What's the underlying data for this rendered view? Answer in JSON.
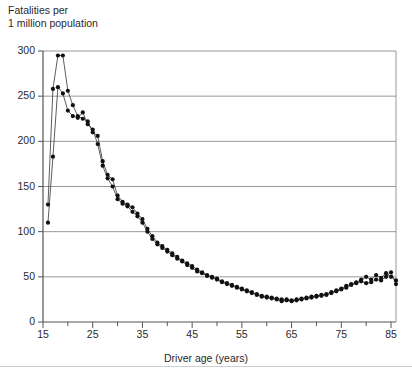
{
  "chart_data": {
    "type": "scatter",
    "title": "",
    "ylabel": "Fatalities per\n1 million population",
    "xlabel": "Driver age (years)",
    "xlim": [
      15,
      86
    ],
    "ylim": [
      0,
      300
    ],
    "yticks": [
      0,
      50,
      100,
      150,
      200,
      250,
      300
    ],
    "xticks": [
      15,
      20,
      25,
      30,
      35,
      40,
      45,
      50,
      55,
      60,
      65,
      70,
      75,
      80,
      85
    ],
    "xtick_labels": [
      "15",
      "",
      "25",
      "",
      "35",
      "",
      "45",
      "",
      "55",
      "",
      "65",
      "",
      "75",
      "",
      "85"
    ],
    "ytick_labels": [
      "0",
      "50",
      "100",
      "150",
      "200",
      "250",
      "300"
    ],
    "grid": "horizontal",
    "legend": "none",
    "marker": "filled-circle",
    "marker_color": "#111111",
    "line_color": "#333333",
    "series": [
      {
        "name": "series-a",
        "x": [
          16,
          17,
          18,
          19,
          20,
          21,
          22,
          23,
          24,
          25,
          26,
          27,
          28,
          29,
          30,
          31,
          32,
          33,
          34,
          35,
          36,
          37,
          38,
          39,
          40,
          41,
          42,
          43,
          44,
          45,
          46,
          47,
          48,
          49,
          50,
          51,
          52,
          53,
          54,
          55,
          56,
          57,
          58,
          59,
          60,
          61,
          62,
          63,
          64,
          65,
          66,
          67,
          68,
          69,
          70,
          71,
          72,
          73,
          74,
          75,
          76,
          77,
          78,
          79,
          80,
          81,
          82,
          83,
          84,
          85,
          86
        ],
        "y": [
          130,
          258,
          295,
          295,
          256,
          240,
          228,
          225,
          222,
          210,
          206,
          178,
          163,
          158,
          140,
          133,
          130,
          127,
          120,
          114,
          103,
          95,
          88,
          84,
          80,
          76,
          72,
          68,
          65,
          62,
          58,
          55,
          52,
          50,
          48,
          45,
          43,
          41,
          39,
          37,
          35,
          33,
          31,
          29,
          28,
          27,
          26,
          25,
          25,
          24,
          25,
          26,
          27,
          28,
          29,
          30,
          31,
          33,
          35,
          37,
          40,
          42,
          44,
          47,
          50,
          47,
          52,
          49,
          54,
          50,
          46
        ]
      },
      {
        "name": "series-b",
        "x": [
          16,
          17,
          18,
          19,
          20,
          21,
          22,
          23,
          24,
          25,
          26,
          27,
          28,
          29,
          30,
          31,
          32,
          33,
          34,
          35,
          36,
          37,
          38,
          39,
          40,
          41,
          42,
          43,
          44,
          45,
          46,
          47,
          48,
          49,
          50,
          51,
          52,
          53,
          54,
          55,
          56,
          57,
          58,
          59,
          60,
          61,
          62,
          63,
          64,
          65,
          66,
          67,
          68,
          69,
          70,
          71,
          72,
          73,
          74,
          75,
          76,
          77,
          78,
          79,
          80,
          81,
          82,
          83,
          84,
          85,
          86
        ],
        "y": [
          110,
          183,
          260,
          253,
          234,
          228,
          226,
          232,
          219,
          213,
          197,
          173,
          159,
          150,
          136,
          131,
          128,
          122,
          117,
          110,
          100,
          92,
          86,
          82,
          78,
          74,
          70,
          67,
          63,
          60,
          56,
          54,
          51,
          49,
          47,
          44,
          42,
          40,
          38,
          36,
          34,
          32,
          30,
          28,
          27,
          26,
          25,
          23,
          24,
          23,
          24,
          25,
          26,
          27,
          28,
          29,
          30,
          32,
          34,
          36,
          38,
          41,
          43,
          45,
          43,
          44,
          47,
          46,
          50,
          55,
          42
        ]
      }
    ]
  }
}
